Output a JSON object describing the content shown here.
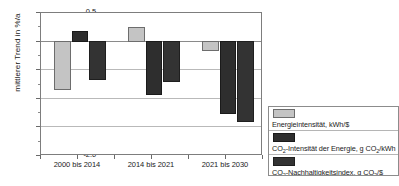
{
  "chart_data": {
    "type": "bar",
    "title": "",
    "subtitle": "",
    "xlabel": "",
    "ylabel": "mittlerer Trend in %/a",
    "categories": [
      "2000 bis 2014",
      "2014 bis 2021",
      "2021 bis 2030"
    ],
    "ylim": [
      -2.0,
      0.5
    ],
    "ytick_labels": [
      "0.5",
      "0.0",
      "-0.5",
      "-1.0",
      "-1.5",
      "-2.0"
    ],
    "ytick_values": [
      0.5,
      0.0,
      -0.5,
      -1.0,
      -1.5,
      -2.0
    ],
    "grid": true,
    "legend_position": "bottom-right",
    "series": [
      {
        "name": "Energieintensität, kWh/$",
        "color": "#c4c4c4",
        "values": [
          -0.84,
          0.24,
          -0.17
        ]
      },
      {
        "name": "CO2-Intensität der Energie, g CO2/kWh",
        "color": "#2e2e2e",
        "values": [
          0.17,
          -0.94,
          -1.26
        ]
      },
      {
        "name": "CO2-Nachhaltigkeitsindex, g CO2/$",
        "color": "#333333",
        "values": [
          -0.67,
          -0.7,
          -1.4
        ]
      }
    ]
  },
  "axis": {
    "y_title": "mittlerer Trend in %/a",
    "ticks": [
      {
        "label": "0.5",
        "value": 0.5
      },
      {
        "label": "0.0",
        "value": 0.0
      },
      {
        "label": "-0.5",
        "value": -0.5
      },
      {
        "label": "-1.0",
        "value": -1.0
      },
      {
        "label": "-1.5",
        "value": -1.5
      },
      {
        "label": "-2.0",
        "value": -2.0
      }
    ]
  },
  "legend": {
    "entries": [
      {
        "key": "energieintensitaet",
        "label": "Energieintensität, kWh/$",
        "parts": [
          {
            "t": "Energieintensität, kWh/$"
          }
        ]
      },
      {
        "key": "co2-intensitaet-energie",
        "label": "CO2-Intensität der Energie, g CO2/kWh",
        "parts": [
          {
            "t": "CO"
          },
          {
            "sub": "2"
          },
          {
            "t": "-Intensität der Energie, g CO"
          },
          {
            "sub": "2"
          },
          {
            "t": "/kWh"
          }
        ]
      },
      {
        "key": "co2-nachhaltigkeitsindex",
        "label": "CO2-Nachhaltigkeitsindex, g CO2/$",
        "parts": [
          {
            "t": "CO"
          },
          {
            "sub": "2"
          },
          {
            "t": "-Nachhaltigkeitsindex, g CO"
          },
          {
            "sub": "2"
          },
          {
            "t": "/$"
          }
        ]
      }
    ]
  }
}
